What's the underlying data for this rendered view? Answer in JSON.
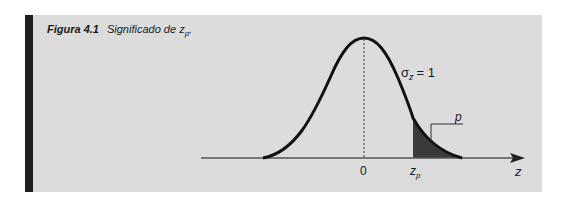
{
  "caption": {
    "figure_label": "Figura 4.1",
    "title_text": "Significado de z",
    "title_subscript": "p",
    "title_suffix": "."
  },
  "figure": {
    "curve": "standard normal density",
    "sigma_label": "σ",
    "sigma_subscript": "z",
    "sigma_value": "= 1",
    "tail_area_label": "p",
    "mean_tick_label": "0",
    "critical_label": "z",
    "critical_subscript": "p",
    "axis_label": "z",
    "colors": {
      "panel": "#dcdcdc",
      "bar": "#1e1e1e",
      "curve": "#111111",
      "shade": "#3a3a3a"
    }
  }
}
